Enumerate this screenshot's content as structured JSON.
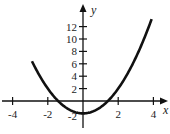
{
  "chart_data": {
    "type": "line",
    "title": "",
    "xlabel": "x",
    "ylabel": "y",
    "xlim": [
      -4.5,
      4.6
    ],
    "ylim": [
      -3,
      15
    ],
    "x_ticks": [
      -4,
      -2,
      2,
      4
    ],
    "y_ticks": [
      2,
      4,
      6,
      8,
      10,
      12
    ],
    "x_tick_labels": [
      "-4",
      "-2",
      "2",
      "4"
    ],
    "y_tick_labels": [
      "2",
      "4",
      "6",
      "8",
      "10",
      "12"
    ],
    "extra_label": {
      "text": "-2",
      "x": -0.5,
      "y": -2
    },
    "grid": false,
    "series": [
      {
        "name": "y = x^2 - 2",
        "function": "x^2 - 2",
        "x_range": [
          -2.9,
          3.9
        ],
        "x": [
          -2.9,
          -2.5,
          -2,
          -1.5,
          -1,
          -0.5,
          0,
          0.5,
          1,
          1.5,
          2,
          2.5,
          3,
          3.5,
          3.9
        ],
        "y": [
          6.41,
          4.25,
          2,
          0.25,
          -1,
          -1.75,
          -2,
          -1.75,
          -1,
          0.25,
          2,
          4.25,
          7,
          10.25,
          13.21
        ]
      }
    ]
  }
}
